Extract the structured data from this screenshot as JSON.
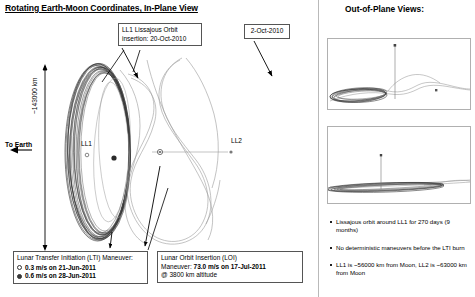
{
  "figure": {
    "title": "Rotating Earth-Moon Coordinates, In-Plane View",
    "right_title": "Out-of-Plane Views:"
  },
  "plot": {
    "to_earth_label": "To Earth",
    "distance_label": "~143000 km",
    "point_ll1": "LL1",
    "point_ll2": "LL2"
  },
  "callouts": {
    "lissajous": {
      "line1": "LL1 Lissajous Orbit",
      "line2": "insertion: 20-Oct-2010"
    },
    "date_oct": {
      "line1": "2-Oct-2010"
    },
    "lti": {
      "heading": "Lunar Transfer Initiation (LTI) Maneuver:",
      "options": [
        {
          "marker": "hollow",
          "label": "0.3 m/s on 21-Jun-2011"
        },
        {
          "marker": "filled",
          "label": "0.6 m/s on 28-Jun-2011"
        }
      ]
    },
    "loi": {
      "line1": "Lunar Orbit Insertion (LOI)",
      "line2_prefix": "Maneuver: ",
      "line2_bold": "73.0 m/s on 17-Jul-2011",
      "line3": "@ 3800 km altitude"
    }
  },
  "notes": [
    "Lissajous orbit around LL1 for 270 days (9 months)",
    "No deterministic maneuvers before the LTI burn",
    "LL1 is ~56000 km from Moon, LL2 is ~63000 km from Moon"
  ],
  "colors": {
    "ink": "#000000",
    "trajectory": "#8a8a8a",
    "orbit_dense": "#2b2b2b",
    "panel_border": "#b0b0b0",
    "callout_border": "#555555"
  }
}
